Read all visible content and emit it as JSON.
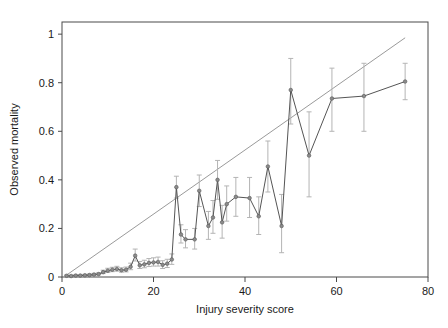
{
  "chart_data": {
    "type": "line",
    "title": "",
    "subtitle": "",
    "xlabel": "Injury severity score",
    "ylabel": "Observed mortality",
    "xlim": [
      0,
      80
    ],
    "ylim": [
      0,
      1.05
    ],
    "xticks": [
      0,
      20,
      40,
      60,
      80
    ],
    "xtick_labels": [
      "0",
      "20",
      "40",
      "60",
      "80"
    ],
    "yticks": [
      0,
      0.2,
      0.4,
      0.6,
      0.8,
      1
    ],
    "ytick_labels": [
      "0",
      "0.2",
      "0.4",
      "0.6",
      "0.8",
      "1"
    ],
    "grid": false,
    "legend": null,
    "legend_position": "none",
    "colors": {
      "series_line": "#555555",
      "marker_fill": "#8c8c8c",
      "error_bar": "#b4b4b4",
      "reference_line": "#9a9a9a",
      "axis": "#4a4a4a",
      "text": "#1a1a1a",
      "background": "#ffffff"
    },
    "series": [
      {
        "name": "Observed mortality",
        "marker": "circle",
        "has_error_bars": true,
        "x": [
          1,
          2,
          3,
          4,
          5,
          6,
          7,
          8,
          9,
          10,
          11,
          12,
          13,
          14,
          15,
          16,
          17,
          18,
          19,
          20,
          21,
          22,
          23,
          24,
          25,
          26,
          27,
          29,
          30,
          32,
          33,
          34,
          35,
          36,
          38,
          41,
          43,
          45,
          48,
          50,
          54,
          59,
          66,
          75
        ],
        "y": [
          0.005,
          0.004,
          0.006,
          0.006,
          0.007,
          0.008,
          0.01,
          0.012,
          0.02,
          0.026,
          0.03,
          0.033,
          0.028,
          0.03,
          0.042,
          0.088,
          0.048,
          0.052,
          0.058,
          0.06,
          0.062,
          0.05,
          0.055,
          0.072,
          0.37,
          0.175,
          0.155,
          0.155,
          0.355,
          0.21,
          0.245,
          0.4,
          0.225,
          0.3,
          0.33,
          0.325,
          0.25,
          0.455,
          0.21,
          0.77,
          0.5,
          0.735,
          0.745,
          0.805
        ],
        "y_err_low": [
          0.004,
          0.003,
          0.004,
          0.004,
          0.005,
          0.006,
          0.007,
          0.009,
          0.014,
          0.019,
          0.022,
          0.024,
          0.02,
          0.021,
          0.03,
          0.066,
          0.035,
          0.038,
          0.043,
          0.045,
          0.045,
          0.035,
          0.039,
          0.052,
          0.325,
          0.14,
          0.12,
          0.115,
          0.29,
          0.155,
          0.18,
          0.32,
          0.16,
          0.23,
          0.25,
          0.245,
          0.175,
          0.35,
          0.1,
          0.63,
          0.33,
          0.6,
          0.6,
          0.73
        ],
        "y_err_high": [
          0.008,
          0.007,
          0.009,
          0.009,
          0.011,
          0.012,
          0.015,
          0.017,
          0.028,
          0.036,
          0.04,
          0.044,
          0.038,
          0.041,
          0.057,
          0.115,
          0.064,
          0.069,
          0.076,
          0.079,
          0.082,
          0.067,
          0.073,
          0.095,
          0.415,
          0.215,
          0.195,
          0.2,
          0.42,
          0.27,
          0.315,
          0.48,
          0.295,
          0.375,
          0.41,
          0.41,
          0.33,
          0.56,
          0.34,
          0.9,
          0.68,
          0.86,
          0.88,
          0.88
        ]
      }
    ],
    "reference_line": {
      "name": "diagonal-reference",
      "x": [
        1,
        75
      ],
      "y": [
        0.008,
        0.985
      ],
      "style": "solid"
    }
  }
}
